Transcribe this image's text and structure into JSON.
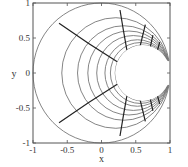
{
  "chart_data": {
    "type": "line",
    "title": "",
    "xlabel": "x",
    "ylabel": "y",
    "xlim": [
      -1,
      1
    ],
    "ylim": [
      -1,
      1
    ],
    "xticks": [
      -1,
      -0.5,
      0,
      0.5,
      1
    ],
    "xtick_labels": [
      "-1",
      "-0.5",
      "0",
      "0.5",
      "1"
    ],
    "yticks": [
      -1,
      -0.5,
      0,
      0.5,
      1
    ],
    "ytick_labels": [
      "-1",
      "-0.5",
      "0",
      "0.5",
      "1"
    ],
    "grid": false,
    "legend": null,
    "tangent_point": [
      1,
      0
    ],
    "circle_family": {
      "description": "gray circles tangent at (1,0), leftmost crossing of y=0 listed",
      "left_crossings": [
        -1,
        -0.58,
        -0.35,
        -0.2,
        -0.07,
        0.05,
        0.13,
        0.2
      ],
      "color": "#777777"
    },
    "hole": {
      "description": "cut-out region bounded by innermost circle and tips near (0.95, ±0.19)",
      "tips": [
        [
          0.95,
          0.19
        ],
        [
          0.95,
          -0.19
        ]
      ]
    },
    "radial_curves": {
      "color": "#222222",
      "series": [
        {
          "name": "curve-1",
          "points": [
            [
              -0.62,
              0.71
            ],
            [
              -0.2,
              0.42
            ],
            [
              0.23,
              0.16
            ]
          ]
        },
        {
          "name": "curve-2",
          "points": [
            [
              0.27,
              0.9
            ],
            [
              0.32,
              0.6
            ],
            [
              0.37,
              0.33
            ]
          ]
        },
        {
          "name": "curve-3",
          "points": [
            [
              0.64,
              0.69
            ],
            [
              0.6,
              0.53
            ],
            [
              0.56,
              0.37
            ]
          ]
        },
        {
          "name": "curve-4",
          "points": [
            [
              0.75,
              0.54
            ],
            [
              0.73,
              0.45
            ],
            [
              0.71,
              0.36
            ]
          ]
        },
        {
          "name": "curve-5",
          "points": [
            [
              0.85,
              0.44
            ],
            [
              0.83,
              0.37
            ],
            [
              0.81,
              0.3
            ]
          ]
        }
      ],
      "mirrored_about_x_axis": true
    }
  }
}
